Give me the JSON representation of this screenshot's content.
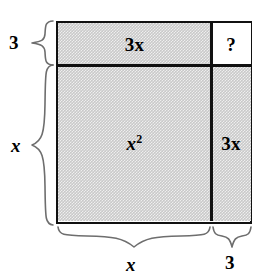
{
  "figure": {
    "cells": [
      {
        "id": "top-left",
        "label": "3x",
        "shaded": true,
        "position": "top-left"
      },
      {
        "id": "top-right",
        "label": "?",
        "shaded": false,
        "position": "top-right"
      },
      {
        "id": "bottom-left",
        "label": "x",
        "exponent": "2",
        "shaded": true,
        "position": "bottom-left"
      },
      {
        "id": "bottom-right",
        "label": "3x",
        "shaded": true,
        "position": "bottom-right"
      }
    ],
    "dimensions": {
      "left_top": "3",
      "left_bottom": "x",
      "bottom_left": "x",
      "bottom_right": "3"
    },
    "colors": {
      "line": "#111111",
      "shade": "#c9c9c9",
      "background": "#ffffff",
      "brace": "#666666"
    }
  }
}
